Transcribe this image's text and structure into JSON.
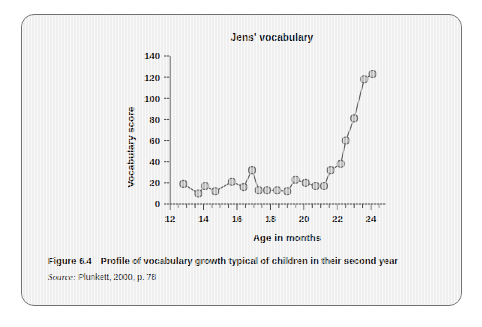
{
  "figure": {
    "number_label": "Figure 6.4",
    "caption": "Profile of vocabulary growth typical of children in their second year",
    "source_word": "Source:",
    "source_text": "Plunkett, 2000, p. 78"
  },
  "colors": {
    "card_background": "#f2f2f2",
    "card_border": "#6e7175",
    "axis": "#4a4a4a",
    "line": "#5c5c5c",
    "marker_fill": "#c2c2c2",
    "marker_stroke": "#6b6b6b",
    "text": "#0e0e0e"
  },
  "chart_data": {
    "type": "line",
    "title": "Jens' vocabulary",
    "xlabel": "Age in months",
    "ylabel": "Vocabulary score",
    "xlim": [
      12,
      24.9
    ],
    "ylim": [
      0,
      140
    ],
    "grid": false,
    "legend": "none",
    "xticks": [
      12,
      14,
      16,
      18,
      20,
      22,
      24
    ],
    "xtick_labels": [
      "12",
      "14",
      "16",
      "18",
      "20",
      "22",
      "24"
    ],
    "x_minor_tick_step": 0.5,
    "yticks": [
      0,
      20,
      40,
      60,
      80,
      100,
      120,
      140
    ],
    "ytick_labels": [
      "0",
      "20",
      "40",
      "60",
      "80",
      "100",
      "120",
      "140"
    ],
    "series": [
      {
        "name": "Jens",
        "marker": "circle",
        "x": [
          12.8,
          13.7,
          14.1,
          14.7,
          15.7,
          16.4,
          16.9,
          17.3,
          17.8,
          18.4,
          19.0,
          19.5,
          20.1,
          20.7,
          21.2,
          21.6,
          22.2,
          22.5,
          23.0,
          23.6,
          24.1
        ],
        "values": [
          19,
          10,
          17,
          12,
          21,
          16,
          32,
          13,
          13,
          13,
          12,
          23,
          20,
          17,
          17,
          32,
          38,
          60,
          81,
          118,
          123
        ]
      }
    ]
  }
}
